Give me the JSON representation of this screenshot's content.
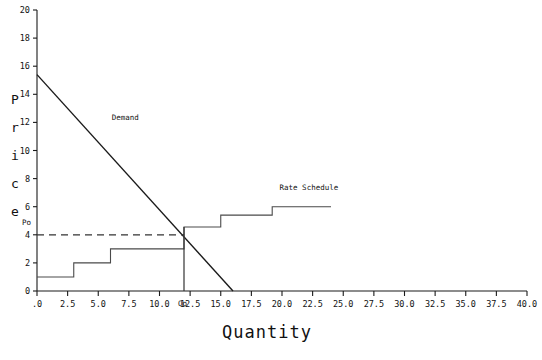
{
  "chart_data": {
    "type": "line",
    "title": "",
    "xlabel": "Quantity",
    "ylabel": "Price",
    "xlim": [
      0,
      40
    ],
    "ylim": [
      0,
      20
    ],
    "grid": false,
    "legend": "inline-annotations",
    "xticks": [
      ".0",
      "2.5",
      "5.0",
      "7.5",
      "10.0",
      "12.5",
      "15.0",
      "17.5",
      "20.0",
      "22.5",
      "25.0",
      "27.5",
      "30.0",
      "32.5",
      "35.0",
      "37.5",
      "40.0"
    ],
    "xtick_values": [
      0,
      2.5,
      5,
      7.5,
      10,
      12.5,
      15,
      17.5,
      20,
      22.5,
      25,
      27.5,
      30,
      32.5,
      35,
      37.5,
      40
    ],
    "yticks": [
      "0",
      "2",
      "4",
      "6",
      "8",
      "10",
      "12",
      "14",
      "16",
      "18",
      "20"
    ],
    "ytick_values": [
      0,
      2,
      4,
      6,
      8,
      10,
      12,
      14,
      16,
      18,
      20
    ],
    "series": [
      {
        "name": "Demand",
        "type": "line",
        "style": "solid",
        "color": "#1a1a1a",
        "points": [
          [
            0,
            15.4
          ],
          [
            16.0,
            0
          ]
        ]
      },
      {
        "name": "Rate Schedule",
        "type": "step",
        "style": "solid",
        "color": "#4a4a4a",
        "points": [
          [
            0,
            1.0
          ],
          [
            3.0,
            1.0
          ],
          [
            3.0,
            2.0
          ],
          [
            6.0,
            2.0
          ],
          [
            6.0,
            3.0
          ],
          [
            12.0,
            3.0
          ],
          [
            12.0,
            4.55
          ],
          [
            15.0,
            4.55
          ],
          [
            15.0,
            5.4
          ],
          [
            19.2,
            5.4
          ],
          [
            19.2,
            6.0
          ],
          [
            24.0,
            6.0
          ]
        ]
      },
      {
        "name": "Po reference",
        "type": "dashed-horizontal",
        "style": "dashed",
        "color": "#333333",
        "y": 4.0,
        "x_from": 0,
        "x_to": 12.0
      },
      {
        "name": "Qo reference",
        "type": "vertical",
        "style": "solid",
        "color": "#333333",
        "x": 12.0,
        "y_from": 0,
        "y_to": 4.55
      }
    ],
    "annotations": [
      {
        "name": "demand-label",
        "text": "Demand",
        "x": 6.1,
        "y": 12.3
      },
      {
        "name": "rate-schedule-label",
        "text": "Rate Schedule",
        "x": 19.8,
        "y": 7.35
      },
      {
        "name": "po-label",
        "text": "Po",
        "x": -1.1,
        "y": 4.85
      },
      {
        "name": "qo-label",
        "text": "Qo",
        "x": 12.0,
        "y": -0.95
      }
    ]
  },
  "axes": {
    "y_axis_title_letters": [
      "P",
      "r",
      "i",
      "c",
      "e"
    ],
    "x_axis_title": "Quantity"
  },
  "colors": {
    "background": "#ffffff",
    "axis": "#1a1a1a",
    "demand": "#1a1a1a",
    "rate_schedule": "#4a4a4a",
    "reference": "#333333",
    "text": "#111111"
  }
}
